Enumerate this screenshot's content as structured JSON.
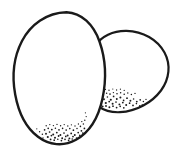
{
  "document": {
    "title": "Two Eggs",
    "subject": "two eggs line drawing",
    "style": "black and white clip art line drawing with stipple shading",
    "width": 183,
    "height": 157,
    "background_color": "#ffffff",
    "ink_color": "#1a1a1a",
    "stroke_width": 2.2
  },
  "objects": [
    {
      "name": "back-egg",
      "label": "Back egg",
      "description": "Tilted oval egg behind and to the right of the front egg",
      "fill_color": "#ffffff",
      "stroke_color": "#1a1a1a",
      "stroke_width": 2.2,
      "outline_path": "M 95.5 45.5 C 101 36.5 113 30.5 126.5 30.8 C 143 31.2 157.5 39.5 164.5 52.5 C 171 64.5 169.5 79 161 90.5 C 152 102.5 136.5 111.5 120 112.2 C 112 112.5 104.5 110.8 99.5 107.2",
      "stipple_zone": {
        "name": "back-egg-shading",
        "description": "Stipple dots along lower-left interior",
        "dots": [
          [
            104.0,
            99.2,
            0.95
          ],
          [
            107.4,
            97.0,
            0.8
          ],
          [
            110.8,
            99.8,
            1.05
          ],
          [
            113.6,
            96.4,
            0.85
          ],
          [
            116.8,
            99.0,
            0.95
          ],
          [
            120.4,
            97.6,
            1.0
          ],
          [
            123.6,
            100.4,
            0.85
          ],
          [
            127.0,
            98.2,
            0.9
          ],
          [
            130.4,
            100.8,
            0.95
          ],
          [
            133.6,
            99.0,
            0.8
          ],
          [
            136.8,
            101.6,
            0.9
          ],
          [
            140.2,
            99.8,
            0.85
          ],
          [
            105.8,
            103.0,
            1.1
          ],
          [
            109.2,
            101.6,
            0.9
          ],
          [
            112.6,
            103.8,
            1.0
          ],
          [
            116.0,
            102.0,
            0.85
          ],
          [
            119.4,
            104.4,
            0.95
          ],
          [
            122.8,
            102.6,
            0.9
          ],
          [
            126.2,
            105.0,
            1.0
          ],
          [
            129.6,
            103.2,
            0.85
          ],
          [
            133.0,
            105.4,
            0.9
          ],
          [
            136.4,
            103.6,
            0.8
          ],
          [
            139.8,
            105.8,
            0.85
          ],
          [
            103.2,
            94.6,
            0.8
          ],
          [
            106.6,
            93.2,
            0.75
          ],
          [
            110.0,
            94.0,
            0.85
          ],
          [
            113.4,
            92.6,
            0.7
          ],
          [
            117.0,
            93.8,
            0.8
          ],
          [
            120.6,
            92.8,
            0.75
          ],
          [
            124.2,
            94.2,
            0.8
          ],
          [
            127.8,
            93.0,
            0.7
          ],
          [
            131.4,
            94.6,
            0.75
          ],
          [
            135.0,
            93.4,
            0.7
          ],
          [
            102.6,
            106.6,
            1.0
          ],
          [
            106.0,
            106.0,
            0.9
          ],
          [
            109.4,
            107.2,
            0.95
          ],
          [
            113.0,
            106.2,
            0.85
          ],
          [
            116.6,
            107.6,
            0.9
          ],
          [
            120.2,
            106.4,
            0.8
          ],
          [
            123.8,
            107.8,
            0.85
          ],
          [
            101.8,
            90.6,
            0.7
          ],
          [
            105.4,
            89.4,
            0.65
          ],
          [
            109.0,
            90.2,
            0.7
          ],
          [
            112.8,
            89.0,
            0.6
          ],
          [
            116.6,
            90.0,
            0.65
          ],
          [
            120.4,
            89.2,
            0.6
          ],
          [
            124.2,
            90.4,
            0.6
          ],
          [
            100.4,
            102.2,
            0.85
          ],
          [
            101.2,
            98.4,
            0.8
          ],
          [
            100.8,
            94.0,
            0.7
          ],
          [
            143.4,
            101.4,
            0.75
          ],
          [
            146.0,
            99.4,
            0.65
          ],
          [
            142.2,
            104.6,
            0.7
          ]
        ]
      }
    },
    {
      "name": "front-egg",
      "label": "Front egg",
      "description": "Large upright egg in front at the left",
      "fill_color": "#ffffff",
      "stroke_color": "#1a1a1a",
      "stroke_width": 2.4,
      "outline_path": "M 66.5 12.2 C 81.5 12.8 93.5 24.5 99.5 41.5 C 105.5 58.5 106.5 79.5 102.5 98.5 C 98.5 117.5 89 132.5 76 139.8 C 63.5 146.8 49 145.2 38 136.8 C 26.5 128.2 18.5 112.5 15.2 94.5 C 11.8 76.0 14.0 56.5 22.0 41.0 C 30.2 25.0 46.5 12.5 66.5 12.2 Z",
      "stipple_zone": {
        "name": "front-egg-shading",
        "description": "Stipple dots along lower-right interior near base",
        "dots": [
          [
            46.0,
            133.8,
            0.95
          ],
          [
            49.6,
            132.0,
            0.85
          ],
          [
            53.2,
            134.4,
            1.0
          ],
          [
            56.8,
            132.6,
            0.9
          ],
          [
            60.4,
            135.0,
            0.95
          ],
          [
            64.0,
            133.0,
            0.85
          ],
          [
            67.6,
            135.4,
            1.0
          ],
          [
            71.2,
            133.4,
            0.9
          ],
          [
            74.8,
            135.0,
            0.95
          ],
          [
            78.2,
            132.6,
            0.85
          ],
          [
            81.4,
            130.8,
            0.9
          ],
          [
            84.4,
            128.4,
            0.85
          ],
          [
            47.8,
            137.0,
            1.05
          ],
          [
            51.4,
            135.6,
            0.9
          ],
          [
            55.0,
            137.8,
            1.0
          ],
          [
            58.6,
            136.0,
            0.9
          ],
          [
            62.2,
            138.2,
            0.95
          ],
          [
            65.8,
            136.4,
            0.85
          ],
          [
            69.4,
            138.4,
            0.95
          ],
          [
            73.0,
            136.6,
            0.9
          ],
          [
            76.6,
            138.0,
            0.85
          ],
          [
            79.8,
            135.4,
            0.8
          ],
          [
            82.8,
            133.0,
            0.85
          ],
          [
            44.6,
            129.8,
            0.85
          ],
          [
            48.2,
            128.4,
            0.8
          ],
          [
            51.8,
            129.6,
            0.9
          ],
          [
            55.4,
            128.2,
            0.8
          ],
          [
            59.0,
            129.8,
            0.85
          ],
          [
            62.6,
            128.4,
            0.8
          ],
          [
            66.2,
            130.0,
            0.85
          ],
          [
            69.8,
            128.6,
            0.8
          ],
          [
            73.4,
            130.2,
            0.85
          ],
          [
            77.0,
            128.4,
            0.75
          ],
          [
            80.4,
            126.4,
            0.8
          ],
          [
            83.4,
            124.0,
            0.75
          ],
          [
            50.6,
            139.4,
            0.9
          ],
          [
            54.2,
            140.2,
            0.85
          ],
          [
            57.8,
            139.2,
            0.8
          ],
          [
            61.4,
            140.6,
            0.85
          ],
          [
            65.0,
            139.4,
            0.8
          ],
          [
            68.6,
            140.4,
            0.85
          ],
          [
            72.2,
            139.0,
            0.8
          ],
          [
            46.2,
            125.8,
            0.7
          ],
          [
            49.8,
            124.6,
            0.65
          ],
          [
            53.4,
            125.6,
            0.7
          ],
          [
            57.0,
            124.4,
            0.65
          ],
          [
            60.6,
            125.8,
            0.7
          ],
          [
            64.2,
            124.6,
            0.65
          ],
          [
            67.8,
            126.0,
            0.7
          ],
          [
            71.4,
            124.8,
            0.65
          ],
          [
            75.0,
            126.0,
            0.7
          ],
          [
            78.4,
            124.0,
            0.65
          ],
          [
            81.8,
            121.6,
            0.7
          ],
          [
            84.8,
            120.2,
            0.7
          ],
          [
            86.2,
            116.6,
            0.65
          ],
          [
            85.4,
            112.8,
            0.6
          ],
          [
            42.4,
            134.2,
            0.75
          ],
          [
            39.6,
            131.8,
            0.7
          ],
          [
            43.0,
            138.0,
            0.7
          ],
          [
            36.8,
            128.8,
            0.6
          ]
        ]
      }
    }
  ]
}
